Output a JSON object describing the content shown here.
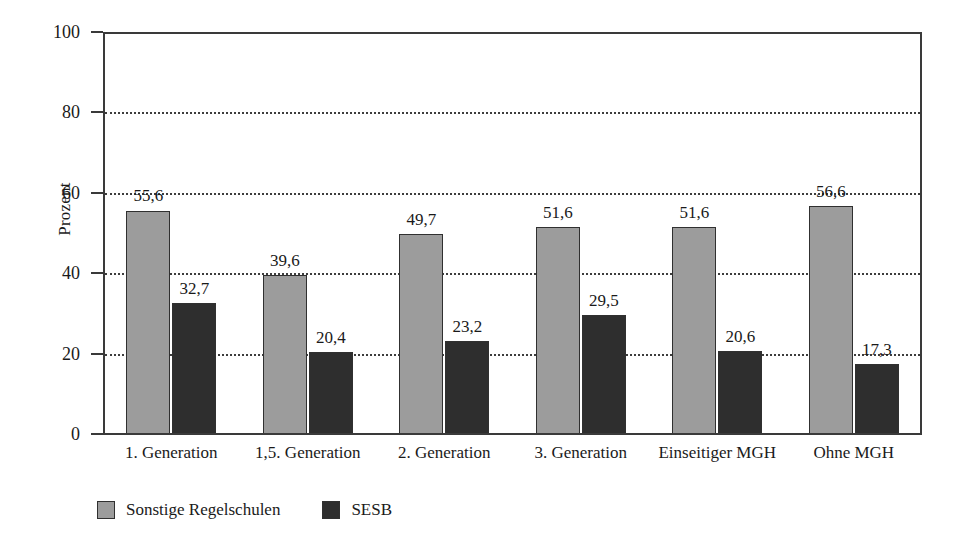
{
  "chart_data": {
    "type": "bar",
    "title": "",
    "xlabel": "",
    "ylabel": "Prozent",
    "ylim": [
      0,
      100
    ],
    "yticks": [
      "0",
      "20",
      "40",
      "60",
      "80",
      "100"
    ],
    "grid": "horizontal-dotted",
    "legend_position": "bottom-left",
    "categories": [
      "1. Generation",
      "1,5. Generation",
      "2. Generation",
      "3. Generation",
      "Einseitiger MGH",
      "Ohne MGH"
    ],
    "series": [
      {
        "name": "Sonstige Regelschulen",
        "color": "#9c9c9c",
        "values": [
          55.6,
          39.6,
          49.7,
          51.6,
          51.6,
          56.6
        ],
        "labels": [
          "55,6",
          "39,6",
          "49,7",
          "51,6",
          "51,6",
          "56,6"
        ]
      },
      {
        "name": "SESB",
        "color": "#2e2e2e",
        "values": [
          32.7,
          20.4,
          23.2,
          29.5,
          20.6,
          17.3
        ],
        "labels": [
          "32,7",
          "20,4",
          "23,2",
          "29,5",
          "20,6",
          "17,3"
        ]
      }
    ]
  }
}
